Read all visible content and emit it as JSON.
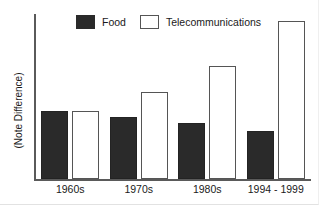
{
  "chart_data": {
    "type": "bar",
    "title": "",
    "xlabel": "",
    "ylabel": "(Note Difference)",
    "categories": [
      "1960s",
      "1970s",
      "1980s",
      "1994 - 1999"
    ],
    "series": [
      {
        "name": "Food",
        "color": "#2a2a2a",
        "style": "filled",
        "values": [
          68,
          62,
          56,
          48
        ]
      },
      {
        "name": "Telecommunications",
        "color": "#ffffff",
        "style": "hollow",
        "values": [
          68,
          87,
          113,
          158
        ]
      }
    ],
    "ylim": [
      0,
      165
    ],
    "grid": false,
    "legend_position": "top-center",
    "axis_color": "#5a5a5a",
    "note": "Y axis is unlabeled; values are relative bar heights in pixels"
  },
  "legend": {
    "items": [
      {
        "label": "Food",
        "swatch": "filled-square-swatch"
      },
      {
        "label": "Telecommunications",
        "swatch": "hollow-square-swatch"
      }
    ]
  },
  "axes": {
    "y_title": "(Note Difference)",
    "x_tick_labels": [
      "1960s",
      "1970s",
      "1980s",
      "1994 - 1999"
    ]
  }
}
